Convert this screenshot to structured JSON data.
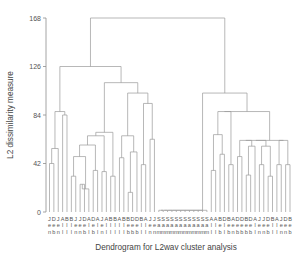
{
  "chart_data": {
    "type": "dendrogram",
    "title": "Dendrogram for L2wav cluster analysis",
    "xlabel": "Dendrogram for L2wav cluster analysis",
    "ylabel": "L2 dissimilarity measure",
    "ylim": [
      0,
      168
    ],
    "yticks": [
      0,
      42,
      84,
      126,
      168
    ],
    "ytick_labels": [
      "0",
      "42",
      "84",
      "126",
      "168"
    ],
    "grid": false,
    "legend": "none",
    "n_leaves": 56,
    "leaf_labels": [
      "Jen",
      "Dee",
      "Jan",
      "Abe",
      "Bob",
      "Bob",
      "Jan",
      "Jen",
      "Dee",
      "Ann",
      "Dad",
      "Ann",
      "Jan",
      "Abe",
      "Bob",
      "Bob",
      "Abe",
      "Bob",
      "Bee",
      "Dee",
      "Deb",
      "Bob",
      "Ann",
      "Jen",
      "Jen",
      "Sam",
      "Sam",
      "Sam",
      "Sam",
      "Sam",
      "Sam",
      "Sam",
      "Sam",
      "Sam",
      "Sam",
      "Sam",
      "Sam",
      "Ann",
      "Ann",
      "Bob",
      "Deb",
      "Bob",
      "Ann",
      "Dad",
      "Deb",
      "Bob",
      "Dee",
      "Ann",
      "Jan",
      "Jen",
      "Dee",
      "Bob",
      "Ann",
      "Jan",
      "Dee",
      "Bob"
    ],
    "leaf_label_rows": [
      [
        "J",
        "D",
        "J",
        "A",
        "B",
        "B",
        "J",
        "J",
        "D",
        "A",
        "D",
        "A",
        "J",
        "A",
        "B",
        "B",
        "A",
        "B",
        "B",
        "D",
        "D",
        "B",
        "A",
        "J",
        "J",
        "S",
        "S",
        "S",
        "S",
        "S",
        "S",
        "S",
        "S",
        "S",
        "S",
        "S",
        "S",
        "A",
        "A",
        "B",
        "D",
        "B",
        "A",
        "D",
        "D",
        "B",
        "D",
        "A",
        "J",
        "J",
        "D",
        "B",
        "A",
        "J",
        "D",
        "B"
      ],
      [
        "e",
        "e",
        "e",
        "l",
        "l",
        "l",
        "e",
        "e",
        "e",
        "l",
        "e",
        "l",
        "e",
        "l",
        "l",
        "l",
        "l",
        "l",
        "e",
        "e",
        "e",
        "l",
        "l",
        "e",
        "e",
        "a",
        "a",
        "a",
        "a",
        "a",
        "a",
        "a",
        "a",
        "a",
        "a",
        "a",
        "a",
        "l",
        "l",
        "e",
        "l",
        "e",
        "e",
        "e",
        "e",
        "e",
        "e",
        "l",
        "e",
        "e",
        "e",
        "l",
        "l",
        "e",
        "e",
        "e"
      ],
      [
        "n",
        "b",
        "n",
        "l",
        "l",
        "l",
        "n",
        "n",
        "b",
        "l",
        "b",
        "l",
        "n",
        "l",
        "l",
        "l",
        "l",
        "l",
        "b",
        "b",
        "b",
        "l",
        "l",
        "n",
        "n",
        "m",
        "m",
        "m",
        "m",
        "m",
        "m",
        "m",
        "m",
        "m",
        "m",
        "m",
        "m",
        "l",
        "l",
        "b",
        "l",
        "b",
        "n",
        "b",
        "b",
        "b",
        "b",
        "l",
        "n",
        "n",
        "b",
        "l",
        "l",
        "n",
        "n",
        "b"
      ]
    ],
    "merge_heights": [
      42,
      55,
      84,
      87,
      31,
      48,
      24,
      20,
      58,
      50,
      36,
      66,
      35,
      31,
      69,
      87,
      47,
      52,
      94,
      103,
      112,
      126,
      168,
      103,
      58,
      67,
      50,
      87,
      35,
      48,
      41,
      17,
      32,
      57,
      62,
      41,
      63,
      74,
      1.5
    ]
  },
  "axes": {
    "y_title": "L2 dissimilarity measure",
    "x_title": "Dendrogram for L2wav cluster analysis",
    "ticks": [
      {
        "value": 168,
        "label": "168"
      },
      {
        "value": 126,
        "label": "126"
      },
      {
        "value": 84,
        "label": "84"
      },
      {
        "value": 42,
        "label": "42"
      },
      {
        "value": 0,
        "label": "0"
      }
    ]
  },
  "colors": {
    "background": "#ffffff",
    "link": "#9a9a9a",
    "axis": "#8e8e8e",
    "text": "#555555"
  }
}
